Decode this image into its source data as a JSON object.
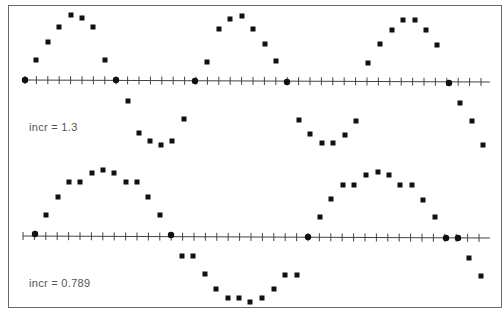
{
  "chart_data": [
    {
      "type": "scatter",
      "title": "",
      "label": "incr = 1.3",
      "xlabel": "",
      "ylabel": "",
      "grid": false,
      "axis": {
        "x_start_px": 25,
        "x_end_px": 490,
        "y_px": 80,
        "tick_spacing_px": 11.4,
        "tick_count": 41
      },
      "points_px": [
        [
          25,
          80
        ],
        [
          36,
          60
        ],
        [
          48,
          42
        ],
        [
          59,
          27
        ],
        [
          71,
          15
        ],
        [
          82,
          18
        ],
        [
          93,
          27
        ],
        [
          105,
          60
        ],
        [
          116,
          80
        ],
        [
          128,
          101
        ],
        [
          139,
          133
        ],
        [
          150,
          141
        ],
        [
          161,
          145
        ],
        [
          172,
          141
        ],
        [
          184,
          119
        ],
        [
          195,
          81
        ],
        [
          207,
          62
        ],
        [
          219,
          29
        ],
        [
          230,
          19
        ],
        [
          242,
          16
        ],
        [
          253,
          29
        ],
        [
          265,
          44
        ],
        [
          276,
          61
        ],
        [
          287,
          82
        ],
        [
          299,
          120
        ],
        [
          310,
          134
        ],
        [
          322,
          143
        ],
        [
          333,
          143
        ],
        [
          345,
          135
        ],
        [
          356,
          121
        ],
        [
          368,
          63
        ],
        [
          380,
          44
        ],
        [
          392,
          30
        ],
        [
          403,
          20
        ],
        [
          415,
          20
        ],
        [
          426,
          30
        ],
        [
          437,
          45
        ],
        [
          449,
          83
        ],
        [
          460,
          103
        ],
        [
          472,
          121
        ],
        [
          483,
          145
        ]
      ],
      "axis_points_px": [
        [
          25,
          80
        ],
        [
          116,
          80
        ],
        [
          195,
          81
        ],
        [
          287,
          82
        ],
        [
          449,
          83
        ]
      ]
    },
    {
      "type": "scatter",
      "title": "",
      "label": "incr = 0.789",
      "xlabel": "",
      "ylabel": "",
      "grid": false,
      "axis": {
        "x_start_px": 23,
        "x_end_px": 490,
        "y_px": 236,
        "tick_spacing_px": 11.4,
        "tick_count": 41
      },
      "points_px": [
        [
          35,
          234
        ],
        [
          46,
          215
        ],
        [
          58,
          197
        ],
        [
          69,
          182
        ],
        [
          80,
          182
        ],
        [
          92,
          173
        ],
        [
          103,
          170
        ],
        [
          114,
          173
        ],
        [
          126,
          182
        ],
        [
          137,
          182
        ],
        [
          148,
          197
        ],
        [
          160,
          215
        ],
        [
          171,
          235
        ],
        [
          182,
          256
        ],
        [
          193,
          256
        ],
        [
          205,
          274
        ],
        [
          216,
          289
        ],
        [
          228,
          298
        ],
        [
          239,
          298
        ],
        [
          250,
          302
        ],
        [
          262,
          298
        ],
        [
          274,
          289
        ],
        [
          285,
          275
        ],
        [
          297,
          275
        ],
        [
          308,
          237
        ],
        [
          320,
          217
        ],
        [
          331,
          199
        ],
        [
          343,
          185
        ],
        [
          354,
          185
        ],
        [
          366,
          175
        ],
        [
          378,
          172
        ],
        [
          389,
          175
        ],
        [
          400,
          185
        ],
        [
          412,
          185
        ],
        [
          423,
          200
        ],
        [
          435,
          217
        ],
        [
          446,
          238
        ],
        [
          458,
          238
        ],
        [
          469,
          258
        ],
        [
          481,
          276
        ]
      ],
      "axis_points_px": [
        [
          35,
          234
        ],
        [
          171,
          235
        ],
        [
          308,
          237
        ],
        [
          446,
          238
        ],
        [
          458,
          238
        ]
      ]
    }
  ],
  "labels": {
    "top": "incr = 1.3",
    "bottom": "incr = 0.789"
  },
  "colors": {
    "marker": "#111111",
    "axis": "#444444",
    "frame": "#6a6a6a",
    "label": "#555555"
  }
}
